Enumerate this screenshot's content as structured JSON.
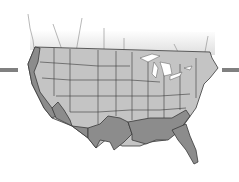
{
  "map": {
    "subject": "Contiguous United States",
    "colors": {
      "interior_states": "#c4c4c4",
      "border_states": "#8c8c8c",
      "state_lines": "#3a3a3a",
      "great_lakes": "#ffffff",
      "canada_fade": "#d8d8d8",
      "side_bars": "#808080"
    },
    "highlighted_regions": [
      "West Coast",
      "Southwest border",
      "Texas",
      "Gulf Coast",
      "Florida",
      "Georgia/South Carolina coast"
    ]
  }
}
